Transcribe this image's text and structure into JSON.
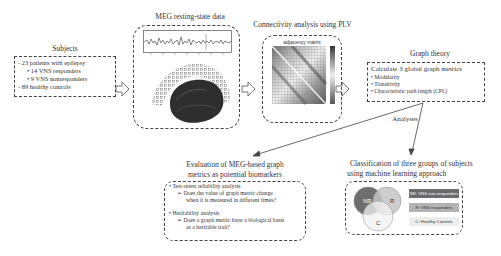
{
  "subjects": {
    "title": "Subjects",
    "lines": [
      "- 23 patients with epilepsy",
      "• 14 VNS responders",
      "• 9 VNS nonresponders",
      "- 89 healthy controls"
    ]
  },
  "meg": {
    "title": "MEG resting-state data",
    "panels": [
      "meg-time-series-icon",
      "sensor-helmet-brain-icon"
    ]
  },
  "connectivity": {
    "title": "Connectivity analysis using PLV",
    "matrix_title": "adjacency matrix"
  },
  "graph_theory": {
    "title": "Graph theory",
    "heading": "Calculate 3 global graph metrics",
    "items": [
      "Modularity",
      "Transitivity",
      "Characteristic path length (CPL)"
    ]
  },
  "analyses_label": "Analyses",
  "evaluation": {
    "title_line1": "Evaluation of MEG-based graph",
    "title_line2": "metrics as potential biomarkers",
    "sections": [
      {
        "bullet": "Test-retest reliability analysis",
        "question_line1": "Does the value of graph metric change",
        "question_line2": "when it is measured in different times?"
      },
      {
        "bullet": "Heritability analysis",
        "question_line1": "Does a graph metric have a biological basis",
        "question_line2": "as a heritable trait?"
      }
    ]
  },
  "classification": {
    "title_line1": "Classification of three groups of subjects",
    "title_line2": "using machine learning approach",
    "venn": [
      "NR",
      "R",
      "C"
    ],
    "legend": [
      {
        "label": "NR: VNS non-responders",
        "color": "#6b6b6b",
        "text_color": "#ffffff"
      },
      {
        "label": "R: VNS responders",
        "color": "#b3b3b3",
        "text_color": "#333333"
      },
      {
        "label": "C: Healthy Controls",
        "color": "#ededed",
        "text_color": "#333333"
      }
    ]
  }
}
